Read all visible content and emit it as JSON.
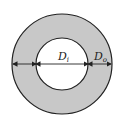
{
  "diagram": {
    "type": "annulus-cross-section",
    "colors": {
      "ring_fill": "#c8c8c8",
      "stroke": "#222222",
      "inner_fill": "#ffffff"
    },
    "labels": {
      "inner_diameter": {
        "main": "D",
        "sub": "i"
      },
      "outer_diameter": {
        "main": "D",
        "sub": "o"
      }
    }
  }
}
